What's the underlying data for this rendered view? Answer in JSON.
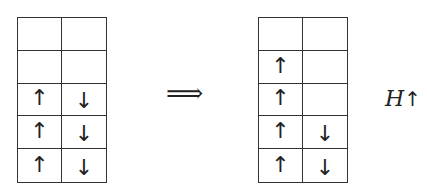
{
  "left_grid": {
    "rows": [
      [
        "",
        ""
      ],
      [
        "",
        ""
      ],
      [
        "↑",
        "↓"
      ],
      [
        "↑",
        "↓"
      ],
      [
        "↑",
        "↓"
      ]
    ]
  },
  "implies_symbol": "⟹",
  "right_grid": {
    "rows": [
      [
        "",
        ""
      ],
      [
        "↑",
        ""
      ],
      [
        "↑",
        ""
      ],
      [
        "↑",
        "↓"
      ],
      [
        "↑",
        "↓"
      ]
    ]
  },
  "operation_label": {
    "operator": "H",
    "spin": "↑"
  }
}
